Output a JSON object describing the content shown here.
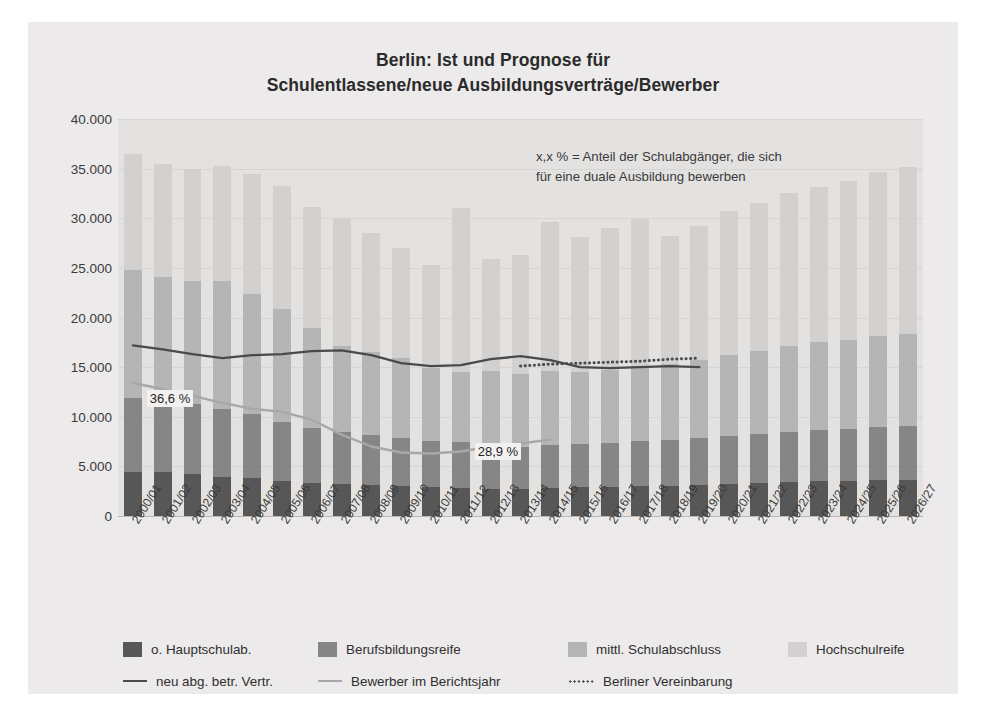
{
  "title": {
    "line1": "Berlin: Ist und Prognose für",
    "line2": "Schulentlassene/neue Ausbildungsverträge/Bewerber"
  },
  "note": {
    "line1": "x,x % = Anteil der Schulabgänger, die sich",
    "line2": "für eine duale Ausbildung bewerben"
  },
  "legend": {
    "bars": [
      {
        "label": "o. Hauptschulab.",
        "color": "#575757"
      },
      {
        "label": "Berufsbildungsreife",
        "color": "#868686"
      },
      {
        "label": "mittl. Schulabschluss",
        "color": "#b5b5b5"
      },
      {
        "label": "Hochschulreife",
        "color": "#d2d1d0"
      }
    ],
    "lines": [
      {
        "label": "neu abg. betr. Vertr.",
        "color": "#4a4a4a",
        "style": "solid"
      },
      {
        "label": "Bewerber im Berichtsjahr",
        "color": "#a8a8a8",
        "style": "solid"
      },
      {
        "label": "Berliner Vereinbarung",
        "color": "#4c4c4c",
        "style": "dotted"
      }
    ]
  },
  "chart_data": {
    "type": "bar",
    "title": "Berlin: Ist und Prognose für Schulentlassene/neue Ausbildungsverträge/Bewerber",
    "xlabel": "",
    "ylabel": "",
    "ylim": [
      0,
      40000
    ],
    "ytick_step": 5000,
    "ytick_labels": [
      "0",
      "5.000",
      "10.000",
      "15.000",
      "20.000",
      "25.000",
      "30.000",
      "35.000",
      "40.000"
    ],
    "grid": true,
    "legend_position": "bottom",
    "stacked": true,
    "categories": [
      "2000/01",
      "2001/02",
      "2002/03",
      "2003/04",
      "2004/05",
      "2005/06",
      "2006/07",
      "2007/08",
      "2008/09",
      "2009/10",
      "2010/11",
      "2011/12",
      "2012/13",
      "2013/14",
      "2014/15",
      "2015/16",
      "2016/17",
      "2017/18",
      "2018/19",
      "2019/20",
      "2020/21",
      "2021/22",
      "2022/23",
      "2023/24",
      "2024/25",
      "2025/26",
      "2026/27"
    ],
    "series": [
      {
        "name": "o. Hauptschulab.",
        "color": "#575757",
        "values": [
          4400,
          4400,
          4200,
          3900,
          3800,
          3500,
          3300,
          3200,
          3100,
          3000,
          2900,
          2800,
          2700,
          2700,
          2800,
          2900,
          2900,
          3000,
          3000,
          3100,
          3200,
          3300,
          3400,
          3500,
          3500,
          3600,
          3600
        ]
      },
      {
        "name": "Berufsbildungsreife",
        "color": "#868686",
        "values": [
          7500,
          7400,
          7100,
          6900,
          6500,
          6000,
          5600,
          5300,
          5100,
          4900,
          4700,
          4700,
          4500,
          4300,
          4400,
          4400,
          4500,
          4600,
          4700,
          4800,
          4900,
          5000,
          5100,
          5200,
          5300,
          5400,
          5500
        ]
      },
      {
        "name": "mittl. Schulabschluss",
        "color": "#b5b5b5",
        "values": [
          12900,
          12300,
          12400,
          12900,
          12100,
          11400,
          10000,
          8600,
          8300,
          8000,
          7300,
          7000,
          7400,
          7300,
          7400,
          7200,
          7300,
          7500,
          7600,
          7800,
          8100,
          8300,
          8600,
          8800,
          8900,
          9100,
          9200
        ]
      },
      {
        "name": "Hochschulreife",
        "color": "#d2d1d0",
        "values": [
          11700,
          11400,
          11300,
          11600,
          12100,
          12400,
          12200,
          12900,
          12000,
          11100,
          10400,
          16500,
          11300,
          12000,
          15000,
          13600,
          14300,
          14800,
          12900,
          13500,
          14500,
          14900,
          15400,
          15700,
          16100,
          16600,
          16900
        ]
      }
    ],
    "lines": [
      {
        "name": "neu abg. betr. Vertr.",
        "color": "#4a4a4a",
        "style": "solid",
        "values": [
          17200,
          16800,
          16300,
          15900,
          16200,
          16300,
          16600,
          16700,
          16200,
          15400,
          15100,
          15200,
          15800,
          16100,
          15700,
          15000,
          14900,
          15000,
          15100,
          15000,
          null,
          null,
          null,
          null,
          null,
          null,
          null
        ]
      },
      {
        "name": "Bewerber im Berichtsjahr",
        "color": "#a8a8a8",
        "style": "solid",
        "values": [
          13400,
          12800,
          12100,
          11400,
          10800,
          10500,
          9700,
          8200,
          7000,
          6400,
          6300,
          6500,
          7000,
          7300,
          7700,
          null,
          null,
          null,
          null,
          null,
          null,
          null,
          null,
          null,
          null,
          null,
          null
        ]
      },
      {
        "name": "Berliner Vereinbarung",
        "color": "#4c4c4c",
        "style": "dotted",
        "values": [
          null,
          null,
          null,
          null,
          null,
          null,
          null,
          null,
          null,
          null,
          null,
          null,
          null,
          15100,
          15300,
          15400,
          15500,
          15600,
          15800,
          15900,
          null,
          null,
          null,
          null,
          null,
          null,
          null
        ]
      }
    ],
    "annotations": [
      {
        "text": "36,6 %",
        "category": "2001/02",
        "value": 11800
      },
      {
        "text": "28,9 %",
        "category": "2012/13",
        "value": 6400
      }
    ]
  }
}
